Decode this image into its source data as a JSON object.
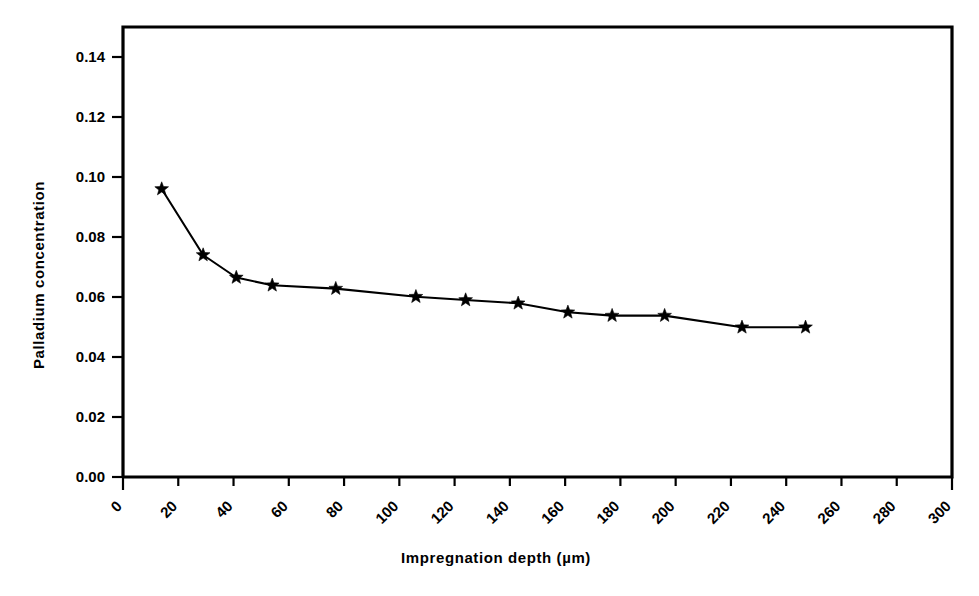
{
  "chart_data": {
    "type": "line",
    "title": "",
    "xlabel": "Impregnation depth (µm)",
    "ylabel": "Palladium  concentration",
    "xlim": [
      0,
      300
    ],
    "ylim": [
      0.0,
      0.15
    ],
    "grid": false,
    "legend": false,
    "marker": "star",
    "line_color": "#000000",
    "marker_color": "#000000",
    "background_color": "#ffffff",
    "x_tick_labels": [
      "0",
      "20",
      "40",
      "60",
      "80",
      "100",
      "120",
      "140",
      "160",
      "180",
      "200",
      "220",
      "240",
      "260",
      "280",
      "300"
    ],
    "x_tick_values": [
      0,
      20,
      40,
      60,
      80,
      100,
      120,
      140,
      160,
      180,
      200,
      220,
      240,
      260,
      280,
      300
    ],
    "x_tick_label_rotation": 45,
    "y_tick_labels": [
      "0.00",
      "0.02",
      "0.04",
      "0.06",
      "0.08",
      "0.10",
      "0.12",
      "0.14"
    ],
    "y_tick_values": [
      0.0,
      0.02,
      0.04,
      0.06,
      0.08,
      0.1,
      0.12,
      0.14
    ],
    "series": [
      {
        "name": "Palladium concentration profile",
        "x": [
          14,
          29,
          41,
          54,
          77,
          106,
          124,
          143,
          161,
          177,
          196,
          224,
          247
        ],
        "values": [
          0.096,
          0.074,
          0.0665,
          0.0639,
          0.0628,
          0.0601,
          0.059,
          0.0579,
          0.0549,
          0.0538,
          0.0538,
          0.0499,
          0.0499
        ]
      }
    ],
    "points": [
      {
        "x": 14,
        "y": 0.096
      },
      {
        "x": 29,
        "y": 0.074
      },
      {
        "x": 41,
        "y": 0.0665
      },
      {
        "x": 54,
        "y": 0.0639
      },
      {
        "x": 77,
        "y": 0.0628
      },
      {
        "x": 106,
        "y": 0.0601
      },
      {
        "x": 124,
        "y": 0.059
      },
      {
        "x": 143,
        "y": 0.0579
      },
      {
        "x": 161,
        "y": 0.0549
      },
      {
        "x": 177,
        "y": 0.0538
      },
      {
        "x": 196,
        "y": 0.0538
      },
      {
        "x": 224,
        "y": 0.0499
      },
      {
        "x": 247,
        "y": 0.0499
      }
    ]
  }
}
